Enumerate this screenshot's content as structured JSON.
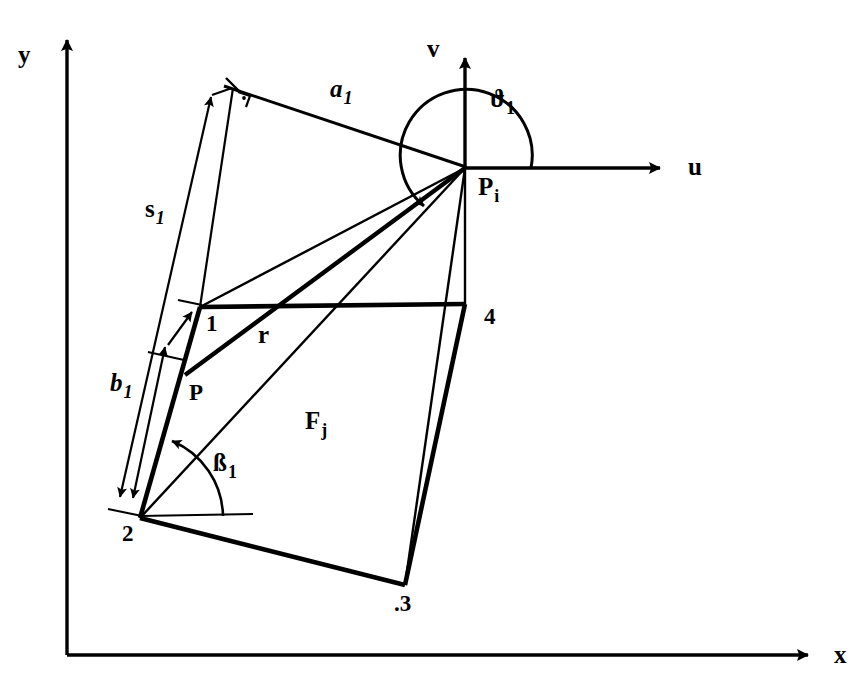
{
  "figure": {
    "type": "technical-line-diagram",
    "background_color": "#ffffff",
    "ink_color": "#000000"
  },
  "global_axes": {
    "x_label": "x",
    "y_label": "y",
    "origin_px": [
      67,
      655
    ],
    "x_tip_px": [
      820,
      655
    ],
    "y_tip_px": [
      67,
      28
    ]
  },
  "local_axes": {
    "origin_name": "P",
    "origin_subscript": "i",
    "u_label": "u",
    "v_label": "v",
    "origin_px": [
      465,
      168
    ],
    "u_tip_px": [
      672,
      168
    ],
    "v_tip_px": [
      465,
      48
    ]
  },
  "angles": [
    {
      "name": "theta-1",
      "glyph": "ϑ",
      "subscript": "1",
      "at": "P_i",
      "from_ray": "u-axis",
      "to_ray": "a1-line",
      "sweep_deg": 200,
      "label_px": [
        492,
        100
      ]
    },
    {
      "name": "beta-1",
      "glyph": "ß",
      "subscript": "1",
      "at": "vertex-2",
      "from_ray": "horizontal-reference",
      "to_ray": "edge-2-to-1",
      "sweep_deg": 72,
      "label_px": [
        216,
        460
      ]
    }
  ],
  "panel": {
    "name": "F",
    "subscript": "j",
    "label_px": [
      310,
      420
    ],
    "vertices": [
      {
        "id": "1",
        "label": "1",
        "px": [
          200,
          307
        ],
        "label_px": [
          209,
          318
        ]
      },
      {
        "id": "2",
        "label": "2",
        "px": [
          140,
          518
        ],
        "label_px": [
          126,
          528
        ]
      },
      {
        "id": "3",
        "label": ".3",
        "px": [
          405,
          585
        ],
        "label_px": [
          397,
          597
        ]
      },
      {
        "id": "4",
        "label": "4",
        "px": [
          465,
          304
        ],
        "label_px": [
          487,
          311
        ]
      }
    ]
  },
  "field_point": {
    "label": "P",
    "px": [
      185,
      375
    ],
    "label_px": [
      190,
      385
    ]
  },
  "dimensions": [
    {
      "name": "a1",
      "glyph": "a",
      "subscript": "1",
      "label_px": [
        332,
        88
      ],
      "from_px": [
        232,
        88
      ],
      "to_px": [
        465,
        168
      ],
      "right_angle_at_px": [
        240,
        95
      ]
    },
    {
      "name": "s1",
      "glyph": "s",
      "subscript": "1",
      "label_px": [
        150,
        208
      ],
      "from_px": [
        118,
        498
      ],
      "to_px": [
        212,
        95
      ]
    },
    {
      "name": "b1",
      "glyph": "b",
      "subscript": "1",
      "label_px": [
        116,
        382
      ],
      "from_px": [
        130,
        500
      ],
      "to_px": [
        163,
        345
      ]
    }
  ],
  "rays_from_Pi": [
    {
      "to": "vertex-1",
      "weight": "thin"
    },
    {
      "to": "field-point-P",
      "weight": "bold",
      "label": "r",
      "label_px": [
        262,
        332
      ]
    },
    {
      "to": "vertex-2",
      "weight": "thin"
    },
    {
      "to": "vertex-3",
      "weight": "thin"
    },
    {
      "to": "vertex-4",
      "weight": "thin"
    }
  ]
}
